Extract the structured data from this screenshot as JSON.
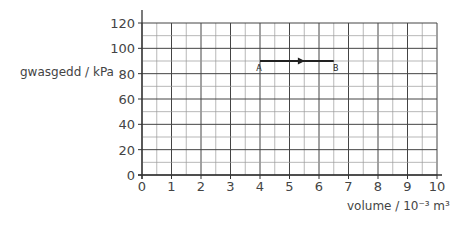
{
  "chart_data": {
    "type": "line",
    "title": "",
    "xlabel": "volume / 10⁻³ m³",
    "ylabel": "gwasgedd / kPa",
    "xlim": [
      0,
      10
    ],
    "ylim": [
      0,
      120
    ],
    "x_ticks": [
      "0",
      "1",
      "2",
      "3",
      "4",
      "5",
      "6",
      "7",
      "8",
      "9",
      "10"
    ],
    "y_ticks": [
      "0",
      "20",
      "40",
      "60",
      "80",
      "100",
      "120"
    ],
    "grid": true,
    "x_minor_step": 0.5,
    "y_minor_step": 10,
    "series": [
      {
        "name": "A to B",
        "points": [
          {
            "label": "A",
            "x": 4,
            "y": 90
          },
          {
            "label": "B",
            "x": 6.5,
            "y": 90
          }
        ],
        "arrow": "A->B",
        "color": "#222222"
      }
    ]
  },
  "labels": {
    "ylabel": "gwasgedd / kPa",
    "xlabel": "volume / 10⁻³ m³",
    "point_a": "A",
    "point_b": "B"
  }
}
